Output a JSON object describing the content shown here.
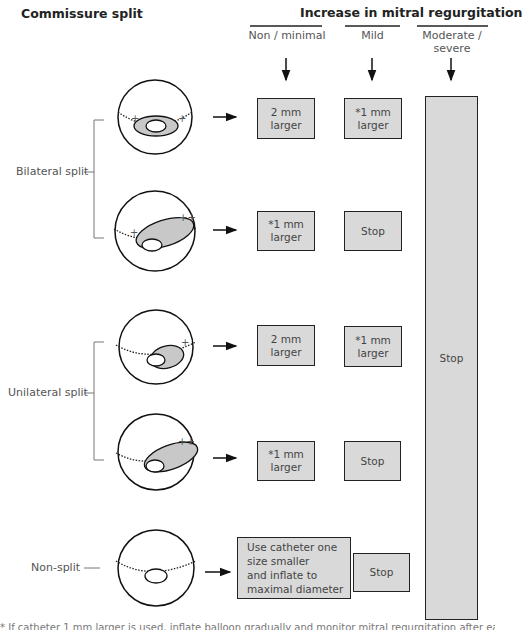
{
  "title": "Commissure split",
  "header": {
    "title": "Increase in mitral regurgitation",
    "columns": [
      {
        "label": "Non / minimal"
      },
      {
        "label": "Mild"
      },
      {
        "label_line1": "Moderate /",
        "label_line2": "severe"
      }
    ]
  },
  "groups": [
    {
      "label": "Bilateral split"
    },
    {
      "label": "Unilateral split"
    },
    {
      "label": "Non-split"
    }
  ],
  "rows": [
    {
      "group": "Bilateral split",
      "plus_marks": [
        "+",
        "+"
      ],
      "non_minimal": {
        "line1": "2 mm",
        "line2": "larger"
      },
      "mild": {
        "line1": "*1 mm",
        "line2": "larger"
      }
    },
    {
      "group": "Bilateral split",
      "plus_marks": [
        "+",
        "++"
      ],
      "non_minimal": {
        "line1": "*1 mm",
        "line2": "larger"
      },
      "mild": {
        "line1": "Stop"
      }
    },
    {
      "group": "Unilateral split",
      "plus_marks": [
        "+"
      ],
      "non_minimal": {
        "line1": "2 mm",
        "line2": "larger"
      },
      "mild": {
        "line1": "*1 mm",
        "line2": "larger"
      }
    },
    {
      "group": "Unilateral split",
      "plus_marks": [
        "++"
      ],
      "non_minimal": {
        "line1": "*1 mm",
        "line2": "larger"
      },
      "mild": {
        "line1": "Stop"
      }
    },
    {
      "group": "Non-split",
      "plus_marks": [],
      "non_minimal": {
        "line1": "Use catheter one",
        "line2": "size smaller",
        "line3": "and inflate to",
        "line4": "maximal diameter"
      },
      "mild": {
        "line1": "Stop"
      }
    }
  ],
  "moderate_severe": {
    "label": "Stop"
  },
  "colors": {
    "box_fill": "#d9d9d9",
    "stroke": "#222222",
    "commissure_fill": "#c8c8c8"
  },
  "footnote": "* If catheter 1 mm larger is used, inflate balloon gradually and monitor mitral regurgitation after each inflation"
}
